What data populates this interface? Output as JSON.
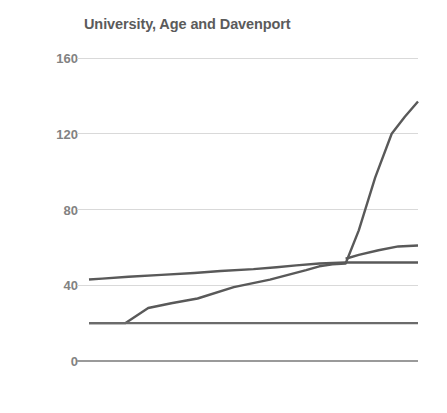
{
  "chart_data": {
    "type": "line",
    "title": "University, Age and Davenport",
    "xlabel": "",
    "ylabel": "",
    "ylim": [
      0,
      160
    ],
    "xlim": [
      0,
      100
    ],
    "yticks": [
      0,
      40,
      80,
      120,
      160
    ],
    "ytick_labels": [
      "0",
      "40",
      "80",
      "120",
      "160"
    ],
    "xticks": [],
    "xtick_labels": [],
    "grid": true,
    "grid_axis": "y",
    "legend": false,
    "legend_position": "none",
    "series": [
      {
        "name": "University",
        "color": "#595959",
        "x": [
          0,
          4,
          12,
          22,
          32,
          40,
          50,
          57,
          63,
          70,
          78,
          85,
          92,
          100
        ],
        "values": [
          43,
          43.5,
          44.5,
          45.5,
          46.5,
          47.5,
          48.5,
          49.5,
          50.5,
          51.5,
          52,
          52,
          52,
          52
        ]
      },
      {
        "name": "Age",
        "color": "#595959",
        "x": [
          78,
          82,
          88,
          94,
          100
        ],
        "values": [
          54,
          56,
          58.5,
          60.5,
          61
        ]
      },
      {
        "name": "Davenport",
        "color": "#595959",
        "x": [
          0,
          11,
          18,
          25,
          33,
          44,
          55,
          66,
          70,
          74,
          78,
          82,
          87,
          92,
          96,
          100
        ],
        "values": [
          20,
          20,
          28,
          30.5,
          33,
          39,
          43,
          48,
          50,
          51,
          51.5,
          69,
          97,
          120,
          129,
          137
        ]
      },
      {
        "name": "Baseline",
        "color": "#6b6b6b",
        "x": [
          0,
          100
        ],
        "values": [
          20,
          20
        ]
      }
    ],
    "colors": {
      "line": "#595959",
      "baseline": "#6b6b6b",
      "gridline": "#d9d9d9",
      "axis": "#9a9a9a",
      "title_text": "#5b5b5b",
      "tick_text": "#828282",
      "background": "#ffffff"
    }
  }
}
